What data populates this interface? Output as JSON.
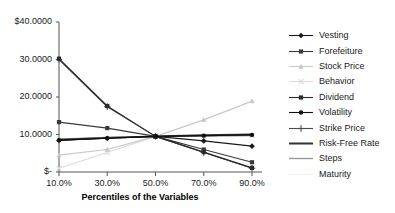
{
  "chart_data": {
    "type": "line",
    "title": "",
    "xlabel": "Percentiles of the Variables",
    "ylabel": "",
    "x": [
      10,
      30,
      50,
      70,
      90
    ],
    "categories": [
      "10.0%",
      "30.0%",
      "50.0%",
      "70.0%",
      "90.0%"
    ],
    "xticklabels": [
      "10.0%",
      "30.0%",
      "50.0%",
      "70.0%",
      "90.0%"
    ],
    "yticklabels": [
      "$40.0000",
      "30.0000",
      "20.0000",
      "10.0000",
      "$-"
    ],
    "yticks": [
      40,
      30,
      20,
      10,
      0
    ],
    "ylim": [
      0,
      40
    ],
    "xlim": [
      10,
      90
    ],
    "grid": false,
    "legend_position": "right",
    "series": [
      {
        "name": "Vesting",
        "color": "#1a1a1a",
        "marker": "diamond",
        "width": 1.1,
        "values": [
          8.4,
          9.0,
          9.5,
          8.3,
          6.9
        ]
      },
      {
        "name": "Forefeiture",
        "color": "#3a3a3a",
        "marker": "square",
        "width": 1.1,
        "values": [
          13.3,
          11.7,
          9.5,
          6.0,
          2.6
        ]
      },
      {
        "name": "Stock Price",
        "color": "#c8c8c8",
        "marker": "triangle",
        "width": 1.1,
        "values": [
          4.5,
          6.0,
          9.5,
          13.9,
          18.9
        ]
      },
      {
        "name": "Behavior",
        "color": "#dcdcdc",
        "marker": "cross",
        "width": 1.1,
        "values": [
          1.0,
          5.2,
          9.5,
          9.6,
          9.7
        ]
      },
      {
        "name": "Dividend",
        "color": "#2a2a2a",
        "marker": "square",
        "width": 1.1,
        "values": [
          30.2,
          17.6,
          9.5,
          5.3,
          1.1
        ]
      },
      {
        "name": "Volatility",
        "color": "#111111",
        "marker": "circle",
        "width": 1.1,
        "values": [
          8.5,
          9.0,
          9.5,
          9.7,
          9.9
        ]
      },
      {
        "name": "Strike Price",
        "color": "#4a4a4a",
        "marker": "plus",
        "width": 1.1,
        "values": [
          30.0,
          17.4,
          9.5,
          5.2,
          1.0
        ]
      },
      {
        "name": "Risk-Free Rate",
        "color": "#333333",
        "marker": "none",
        "width": 2.0,
        "values": [
          8.6,
          9.1,
          9.5,
          9.8,
          10.0
        ]
      },
      {
        "name": "Steps",
        "color": "#9a9a9a",
        "marker": "none",
        "width": 1.4,
        "values": [
          8.7,
          9.2,
          9.5,
          9.6,
          9.7
        ]
      },
      {
        "name": "Maturity",
        "color": "#efefef",
        "marker": "none",
        "width": 1.0,
        "values": [
          9.0,
          9.3,
          9.5,
          9.6,
          9.8
        ]
      }
    ]
  },
  "legend": {
    "items": [
      {
        "label": "Vesting"
      },
      {
        "label": "Forefeiture"
      },
      {
        "label": "Stock Price"
      },
      {
        "label": "Behavior"
      },
      {
        "label": "Dividend"
      },
      {
        "label": "Volatility"
      },
      {
        "label": "Strike Price"
      },
      {
        "label": "Risk-Free Rate"
      },
      {
        "label": "Steps"
      },
      {
        "label": "Maturity"
      }
    ]
  },
  "axes": {
    "x_title": "Percentiles of the Variables",
    "axis_color": "#555555"
  }
}
